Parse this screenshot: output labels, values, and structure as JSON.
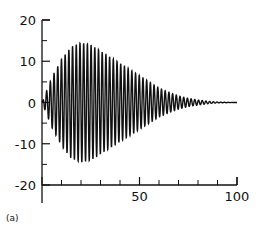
{
  "chart_data": {
    "type": "line",
    "title": "",
    "panel_label": "(a)",
    "xlabel": "",
    "ylabel": "",
    "xlim": [
      0,
      100
    ],
    "ylim": [
      -20,
      20
    ],
    "x_ticks": [
      0,
      50,
      100
    ],
    "x_tick_labels": [
      "",
      "50",
      "100"
    ],
    "x_minor_ticks": [
      10,
      20,
      30,
      40,
      60,
      70,
      80,
      90
    ],
    "y_ticks": [
      -20,
      -10,
      0,
      10,
      20
    ],
    "y_tick_labels": [
      "-20",
      "-10",
      "0",
      "10",
      "20"
    ],
    "y_minor_ticks": [
      -15,
      -5,
      5,
      15
    ],
    "grid": false,
    "legend": null,
    "envelope": {
      "x": [
        0,
        5,
        10,
        15,
        20,
        25,
        30,
        35,
        40,
        45,
        50,
        55,
        60,
        65,
        70,
        75,
        80,
        85,
        90,
        95,
        100
      ],
      "amplitude": [
        0,
        6,
        10.5,
        13.5,
        14.5,
        14,
        12.5,
        11,
        9.5,
        8,
        6.5,
        5,
        3.5,
        2.5,
        1.6,
        1,
        0.6,
        0.3,
        0.1,
        0.05,
        0
      ]
    },
    "oscillation_period": 1.9,
    "series": [
      {
        "name": "signal",
        "color": "#111111"
      }
    ]
  }
}
